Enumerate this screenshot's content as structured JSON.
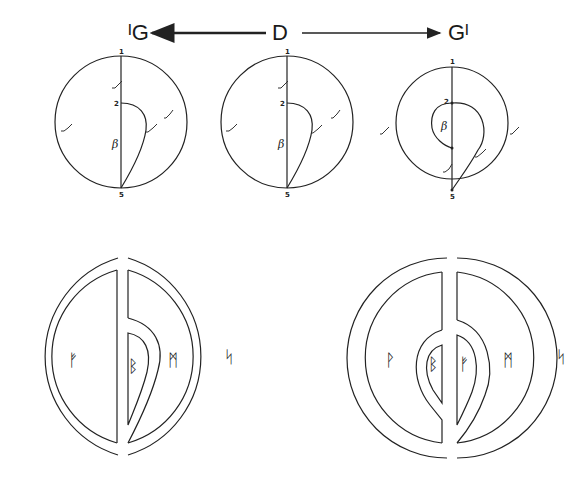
{
  "header": {
    "left_label": "ᴵG",
    "center_label": "D",
    "right_label": "Gᴵ"
  },
  "top_diagrams": [
    {
      "name": "left",
      "labels": {
        "top": "1",
        "mid": "2",
        "bottom": "5",
        "region": "β"
      }
    },
    {
      "name": "center",
      "labels": {
        "top": "1",
        "mid": "2",
        "bottom": "5",
        "region": "β"
      }
    },
    {
      "name": "right",
      "labels": {
        "top": "1",
        "mid": "2",
        "bottom": "5",
        "region": "β"
      }
    }
  ],
  "bottom_diagrams": [
    {
      "name": "left",
      "runes": {
        "left": "ᚠ",
        "inner": "ᛒ",
        "right": "ᛗ",
        "outside": "ᛋ"
      }
    },
    {
      "name": "right",
      "runes": {
        "left": "ᚹ",
        "inner_left": "ᛒ",
        "inner_right": "ᚠ",
        "right": "ᛗ",
        "outside": "ᛋ"
      }
    }
  ],
  "colors": {
    "ink": "#222222",
    "background": "#ffffff"
  }
}
